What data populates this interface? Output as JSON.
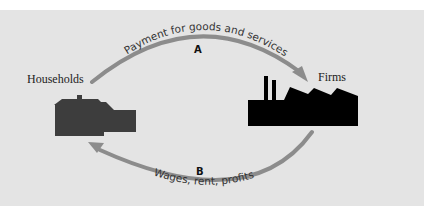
{
  "diagram": {
    "nodes": {
      "households": {
        "label": "Households",
        "icon": "houses-icon",
        "color": "#3d3d3d"
      },
      "firms": {
        "label": "Firms",
        "icon": "factory-icon",
        "color": "#000000"
      }
    },
    "flows": {
      "a": {
        "letter": "A",
        "label": "Payment for goods and services",
        "from": "Households",
        "to": "Firms"
      },
      "b": {
        "letter": "B",
        "label": "Wages, rent, profits",
        "from": "Firms",
        "to": "Households"
      }
    },
    "colors": {
      "background": "#e4e4e4",
      "arrow": "#8c8c8c",
      "page": "#ffffff"
    }
  }
}
